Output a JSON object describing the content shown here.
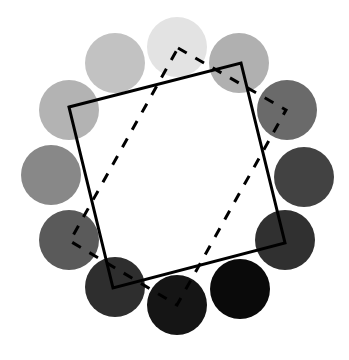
{
  "diagram": {
    "background": "#ffffff",
    "circle_radius": 30,
    "circles": [
      {
        "name": "circle-1-top",
        "cx": 177,
        "cy": 47,
        "fill": "#e3e3e3"
      },
      {
        "name": "circle-2-top-right",
        "cx": 239,
        "cy": 63,
        "fill": "#b0b0b0"
      },
      {
        "name": "circle-3-right-upper",
        "cx": 287,
        "cy": 110,
        "fill": "#6a6a6a"
      },
      {
        "name": "circle-4-right",
        "cx": 304,
        "cy": 177,
        "fill": "#424242"
      },
      {
        "name": "circle-5-right-lower",
        "cx": 285,
        "cy": 240,
        "fill": "#303030"
      },
      {
        "name": "circle-6-bottom-right",
        "cx": 240,
        "cy": 289,
        "fill": "#0a0a0a"
      },
      {
        "name": "circle-7-bottom",
        "cx": 177,
        "cy": 305,
        "fill": "#151515"
      },
      {
        "name": "circle-8-bottom-left",
        "cx": 115,
        "cy": 287,
        "fill": "#2e2e2e"
      },
      {
        "name": "circle-9-left-lower",
        "cx": 69,
        "cy": 240,
        "fill": "#5a5a5a"
      },
      {
        "name": "circle-10-left",
        "cx": 51,
        "cy": 175,
        "fill": "#888888"
      },
      {
        "name": "circle-11-left-upper",
        "cx": 69,
        "cy": 110,
        "fill": "#b3b3b3"
      },
      {
        "name": "circle-12-top-left",
        "cx": 115,
        "cy": 63,
        "fill": "#c2c2c2"
      }
    ],
    "solid_square": {
      "points": "69,107 241,63 285,243 113,288",
      "stroke": "#000000",
      "stroke_width": 3
    },
    "dashed_quad": {
      "points": "178,48 286,110 177,305 70,241",
      "stroke": "#000000",
      "stroke_width": 3,
      "dasharray": "10,10"
    }
  }
}
